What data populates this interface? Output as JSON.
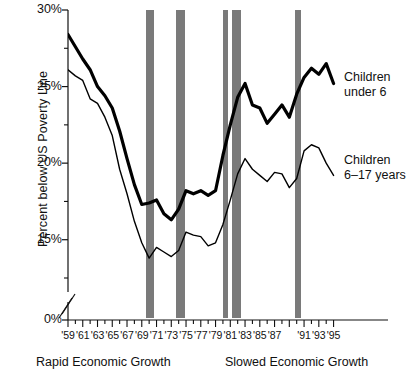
{
  "chart_data": {
    "type": "line",
    "title": "",
    "xlabel": "",
    "ylabel": "Percent below US Poverty Line",
    "ylim": [
      0,
      30
    ],
    "y_axis_break_between": [
      0,
      12.5
    ],
    "grid": false,
    "legend_position": "right-inline",
    "y_ticks_major": [
      "0%",
      "15%",
      "20%",
      "25%",
      "30%"
    ],
    "y_ticks_major_values": [
      0,
      15,
      20,
      25,
      30
    ],
    "y_ticks_minor_values": [
      12.5,
      17.5,
      22.5,
      27.5
    ],
    "x_tick_labels": [
      "'59",
      "'61",
      "'63",
      "'65",
      "'67",
      "'69",
      "'71",
      "'73",
      "'75",
      "'77",
      "'79",
      "'81",
      "'83",
      "'85",
      "'87",
      "'91",
      "'93",
      "'95"
    ],
    "x_range": [
      1959,
      1995
    ],
    "annotations": [
      {
        "text": "Rapid Economic Growth",
        "position": "below-axis-left"
      },
      {
        "text": "Slowed Economic Growth",
        "position": "below-axis-right"
      }
    ],
    "shaded_bands": {
      "name": "recession-bars",
      "color": "#7a7a7a",
      "ranges": [
        [
          1969.6,
          1970.7
        ],
        [
          1973.6,
          1974.8
        ],
        [
          1980.0,
          1980.6
        ],
        [
          1981.2,
          1982.5
        ],
        [
          1989.8,
          1990.6
        ]
      ]
    },
    "series": [
      {
        "name": "Children under 6",
        "color": "#000000",
        "line_width": 3.2,
        "x": [
          1959,
          1960,
          1961,
          1962,
          1963,
          1964,
          1965,
          1966,
          1967,
          1968,
          1969,
          1970,
          1971,
          1972,
          1973,
          1974,
          1975,
          1976,
          1977,
          1978,
          1979,
          1980,
          1981,
          1982,
          1983,
          1984,
          1985,
          1986,
          1987,
          1988,
          1989,
          1990,
          1991,
          1992,
          1993,
          1994,
          1995
        ],
        "values": [
          28.4,
          27.6,
          26.8,
          26.1,
          25.0,
          24.4,
          23.6,
          22.1,
          20.3,
          18.6,
          17.3,
          17.4,
          17.6,
          16.7,
          16.3,
          17.0,
          18.2,
          18.0,
          18.2,
          17.9,
          18.2,
          20.5,
          22.5,
          24.3,
          25.2,
          23.8,
          23.6,
          22.6,
          23.2,
          23.8,
          23.0,
          24.5,
          25.6,
          26.2,
          25.8,
          26.5,
          25.2
        ]
      },
      {
        "name": "Children 6–17 years",
        "color": "#000000",
        "line_width": 1.4,
        "x": [
          1959,
          1960,
          1961,
          1962,
          1963,
          1964,
          1965,
          1966,
          1967,
          1968,
          1969,
          1970,
          1971,
          1972,
          1973,
          1974,
          1975,
          1976,
          1977,
          1978,
          1979,
          1980,
          1981,
          1982,
          1983,
          1984,
          1985,
          1986,
          1987,
          1988,
          1989,
          1990,
          1991,
          1992,
          1993,
          1994,
          1995
        ],
        "values": [
          26.1,
          25.7,
          25.4,
          24.2,
          23.9,
          23.0,
          21.8,
          19.6,
          18.0,
          16.2,
          14.8,
          13.8,
          14.5,
          14.2,
          13.9,
          14.3,
          15.5,
          15.3,
          15.2,
          14.6,
          14.8,
          16.0,
          17.6,
          19.3,
          20.3,
          19.6,
          19.2,
          18.8,
          19.4,
          19.3,
          18.4,
          19.0,
          20.8,
          21.2,
          21.0,
          20.0,
          19.2
        ]
      }
    ]
  },
  "labels": {
    "series_under6_line1": "Children",
    "series_under6_line2": "under 6",
    "series_6to17_line1": "Children",
    "series_6to17_line2": "6–17 years",
    "growth_left": "Rapid Economic Growth",
    "growth_right": "Slowed Economic Growth",
    "y_axis_title": "Percent below US Poverty Line"
  }
}
